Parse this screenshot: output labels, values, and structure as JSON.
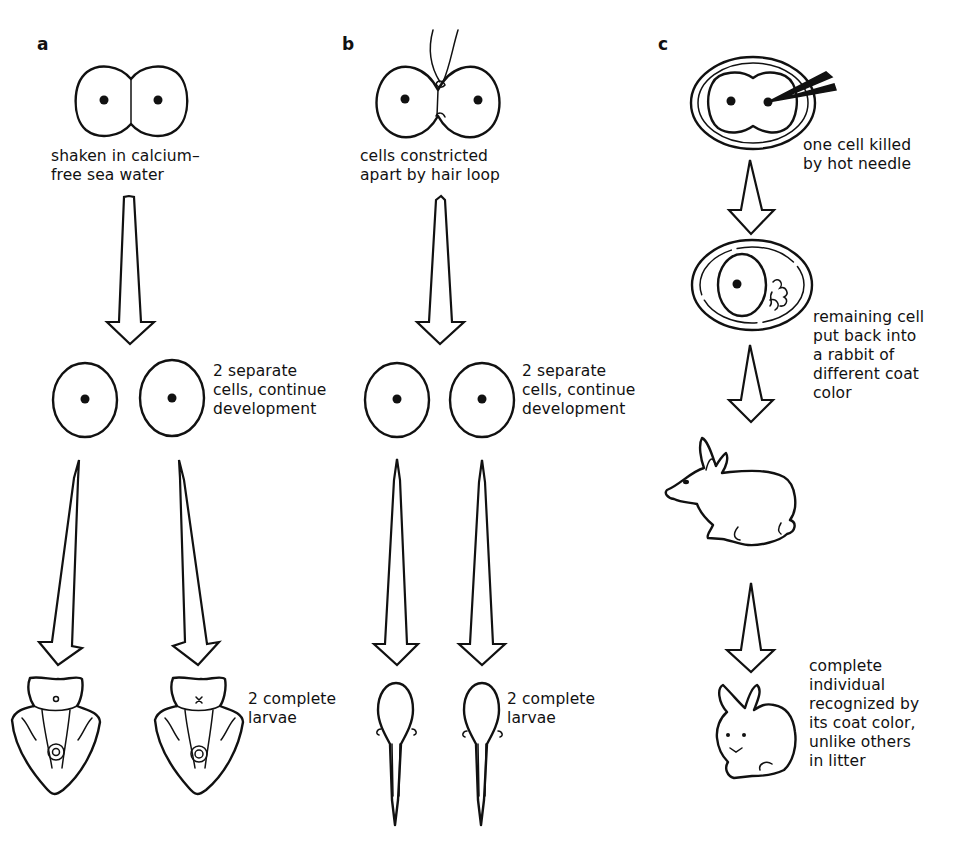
{
  "figure": {
    "panels": [
      {
        "letter": "a",
        "step1_caption": "shaken in calcium–\nfree sea water",
        "step2_caption": "2 separate\ncells, continue\ndevelopment",
        "step3_caption": "2 complete\nlarvae",
        "organism_result": "sea urchin larvae"
      },
      {
        "letter": "b",
        "step1_caption": "cells constricted\napart by hair loop",
        "step2_caption": "2 separate\ncells, continue\ndevelopment",
        "step3_caption": "2 complete\nlarvae",
        "organism_result": "amphibian tadpoles"
      },
      {
        "letter": "c",
        "step1_caption": "one cell killed\nby hot needle",
        "step2_caption": "remaining cell\nput back into\na rabbit of\ndifferent coat\ncolor",
        "step3_caption": "complete\nindividual\nrecognized by\nits coat color,\nunlike others\nin litter",
        "organism_result": "rabbit"
      }
    ],
    "icons": {
      "arrow": "down-arrow-icon",
      "two_cell_embryo": "two-cell-embryo-icon",
      "single_cell": "cell-icon",
      "needle": "hot-needle-icon",
      "hair_loop": "hair-loop-icon",
      "larva": "larva-icon",
      "tadpole": "tadpole-icon",
      "rabbit": "rabbit-icon"
    },
    "colors": {
      "ink": "#111111",
      "background": "#ffffff"
    }
  }
}
